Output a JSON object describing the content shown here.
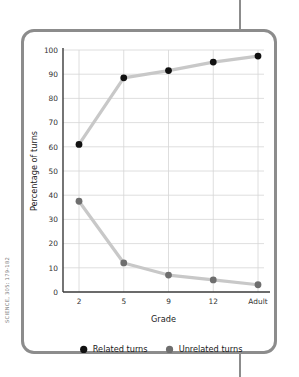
{
  "citation": "SCIENCE, 305: 179-182",
  "chart_data": {
    "type": "line",
    "title": "",
    "xlabel": "Grade",
    "ylabel": "Percentage of turns",
    "categories": [
      "2",
      "5",
      "9",
      "12",
      "Adult"
    ],
    "ylim": [
      0,
      100
    ],
    "yticks": [
      "0",
      "10",
      "20",
      "30",
      "40",
      "50",
      "60",
      "70",
      "80",
      "90",
      "100"
    ],
    "grid": true,
    "legend_position": "bottom",
    "series": [
      {
        "name": "Related turns",
        "color": "#111111",
        "line_color": "#c8c8c8",
        "marker": "circle",
        "values": [
          61,
          88.5,
          91.5,
          95,
          97.5
        ]
      },
      {
        "name": "Unrelated turns",
        "color": "#6e6e6e",
        "line_color": "#c8c8c8",
        "marker": "circle",
        "values": [
          37.5,
          12,
          7,
          5,
          3
        ]
      }
    ]
  },
  "colors": {
    "frame": "#8c8c8c",
    "grid": "#d6d6d6",
    "axis": "#3a3a3a",
    "related_marker": "#111111",
    "unrelated_marker": "#6e6e6e",
    "connector_line": "#c8c8c8"
  }
}
